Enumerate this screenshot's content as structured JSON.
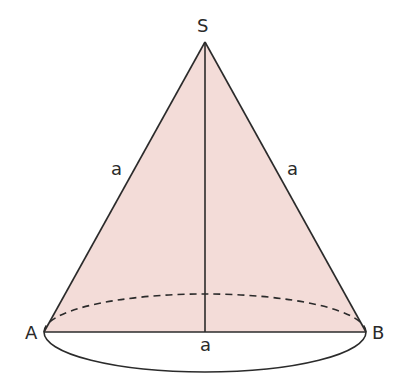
{
  "diagram": {
    "type": "cone",
    "colors": {
      "fill": "#f3dcd8",
      "stroke": "#2b2b2b",
      "background": "#ffffff"
    },
    "points": {
      "apex": {
        "label": "S",
        "x": 205,
        "y": 42
      },
      "left": {
        "label": "A",
        "x": 44,
        "y": 332
      },
      "right": {
        "label": "B",
        "x": 366,
        "y": 332
      }
    },
    "base_ellipse": {
      "cx": 205,
      "cy": 332,
      "rx": 161,
      "ry": 40
    },
    "edge_labels": {
      "left_slant": "a",
      "right_slant": "a",
      "base": "a"
    }
  }
}
